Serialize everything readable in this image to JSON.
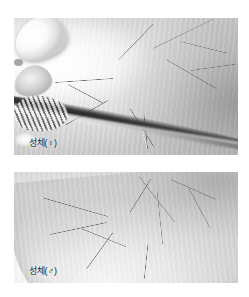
{
  "page": {
    "background_color": "#ffffff",
    "figure_count": 2
  },
  "figures": [
    {
      "id": "figure-adult-female",
      "caption": "성체(♀)",
      "subject": "lynx spider adult female on leaf",
      "rendering": "grayscale photograph",
      "icon_names": [
        "spider-body",
        "leaf-stem",
        "leg-hairline"
      ]
    },
    {
      "id": "figure-adult-male",
      "caption": "성체(♂)",
      "subject": "lynx spider adult male on curved leaf with water droplet",
      "rendering": "grayscale photograph",
      "icon_names": [
        "spider-body",
        "water-droplet",
        "leaf-ridge",
        "leg-hairline"
      ]
    }
  ],
  "colors": {
    "page_bg": "#ffffff",
    "photo_mid_gray": "#cfcfcf",
    "photo_light_gray": "#f4f4f4",
    "photo_dark": "#2b2b2b",
    "caption_text": "#1b1b1b"
  }
}
